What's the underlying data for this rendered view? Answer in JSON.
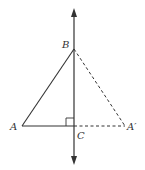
{
  "diagram": {
    "type": "geometry-reflection",
    "colors": {
      "stroke": "#333333",
      "background": "#ffffff"
    },
    "points": {
      "A": {
        "label": "A",
        "x": 22,
        "y": 126
      },
      "B": {
        "label": "B",
        "x": 74,
        "y": 49
      },
      "C": {
        "label": "C",
        "x": 74,
        "y": 126
      },
      "A_prime": {
        "label": "A′",
        "x": 125,
        "y": 126
      }
    },
    "segments": [
      {
        "from": "A",
        "to": "B",
        "style": "solid"
      },
      {
        "from": "A",
        "to": "C",
        "style": "solid"
      },
      {
        "from": "B",
        "to": "A_prime",
        "style": "dashed"
      },
      {
        "from": "C",
        "to": "A_prime",
        "style": "dashed"
      }
    ],
    "axis_line": {
      "x": 74,
      "y_top": 10,
      "y_bottom": 163,
      "arrows": "both"
    },
    "right_angle_marker": {
      "at": "C",
      "size": 8
    }
  }
}
